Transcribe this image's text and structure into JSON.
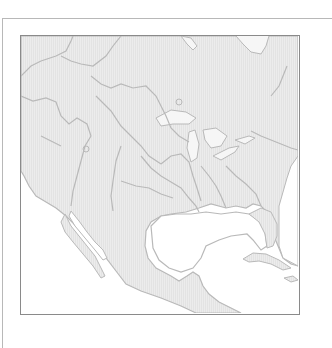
{
  "map": {
    "title": "",
    "region": "North America (blank outline, watershed boundaries)",
    "colors": {
      "land": "#ececec",
      "land_hatch": "#e2e2e2",
      "water": "#ffffff",
      "boundary": "#b9b9b9",
      "frame": "#8a8a8a",
      "outer_frame": "#b8b8b8"
    },
    "labels": []
  }
}
